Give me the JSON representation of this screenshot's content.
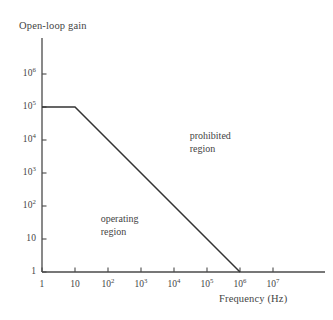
{
  "chart_data": {
    "type": "line",
    "title": "",
    "xlabel": "Frequency (Hz)",
    "ylabel": "Open-loop gain",
    "xscale": "log",
    "yscale": "log",
    "xlim": [
      1,
      10000000
    ],
    "ylim": [
      1,
      1000000
    ],
    "grid": false,
    "legend": "none",
    "x_ticks": [
      {
        "value": 1,
        "mantissa": "1",
        "exponent": ""
      },
      {
        "value": 10,
        "mantissa": "10",
        "exponent": ""
      },
      {
        "value": 100,
        "mantissa": "10",
        "exponent": "2"
      },
      {
        "value": 1000,
        "mantissa": "10",
        "exponent": "3"
      },
      {
        "value": 10000,
        "mantissa": "10",
        "exponent": "4"
      },
      {
        "value": 100000,
        "mantissa": "10",
        "exponent": "5"
      },
      {
        "value": 1000000,
        "mantissa": "10",
        "exponent": "6"
      },
      {
        "value": 10000000,
        "mantissa": "10",
        "exponent": "7"
      }
    ],
    "y_ticks": [
      {
        "value": 1000000,
        "mantissa": "10",
        "exponent": "6"
      },
      {
        "value": 100000,
        "mantissa": "10",
        "exponent": "5"
      },
      {
        "value": 10000,
        "mantissa": "10",
        "exponent": "4"
      },
      {
        "value": 1000,
        "mantissa": "10",
        "exponent": "3"
      },
      {
        "value": 100,
        "mantissa": "10",
        "exponent": "2"
      },
      {
        "value": 10,
        "mantissa": "10",
        "exponent": ""
      },
      {
        "value": 1,
        "mantissa": "1",
        "exponent": ""
      }
    ],
    "series": [
      {
        "name": "open-loop gain limit",
        "points": [
          {
            "x": 1,
            "y": 100000
          },
          {
            "x": 10,
            "y": 100000
          },
          {
            "x": 1000000,
            "y": 1
          }
        ]
      }
    ],
    "annotations": [
      {
        "id": "prohibited",
        "line1": "prohibited",
        "line2": "region",
        "x": 30000,
        "y": 20000
      },
      {
        "id": "operating",
        "line1": "operating",
        "line2": "region",
        "x": 60,
        "y": 60
      }
    ],
    "colors": {
      "background": "#ffffff",
      "axis": "#4a4a4a",
      "line": "#333333",
      "text": "#444444"
    }
  }
}
